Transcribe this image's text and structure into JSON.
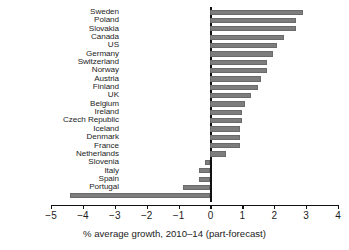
{
  "chart_data": {
    "type": "bar",
    "orientation": "horizontal",
    "title": "",
    "xlabel": "% average growth, 2010–14 (part-forecast)",
    "ylabel": "",
    "xlim": [
      -5,
      4
    ],
    "xticks": [
      -5,
      -4,
      -3,
      -2,
      -1,
      0,
      1,
      2,
      3,
      4
    ],
    "xtick_labels": [
      "−5",
      "−4",
      "−3",
      "−2",
      "−1",
      "0",
      "1",
      "2",
      "3",
      "4"
    ],
    "grid": false,
    "legend": null,
    "bar_color": "#7d7d7d",
    "categories": [
      "Sweden",
      "Poland",
      "Slovakia",
      "Canada",
      "US",
      "Germany",
      "Switzerland",
      "Norway",
      "Austria",
      "Finland",
      "UK",
      "Belgium",
      "Ireland",
      "Czech Republic",
      "Iceland",
      "Denmark",
      "France",
      "Netherlands",
      "Slovenia",
      "Italy",
      "Spain",
      "Portugal",
      "Greece"
    ],
    "values": [
      2.9,
      2.67,
      2.67,
      2.3,
      2.08,
      1.97,
      1.78,
      1.78,
      1.57,
      1.48,
      1.27,
      1.08,
      1.0,
      1.0,
      0.92,
      0.92,
      0.92,
      0.5,
      -0.17,
      -0.37,
      -0.37,
      -0.85,
      -4.4
    ]
  }
}
